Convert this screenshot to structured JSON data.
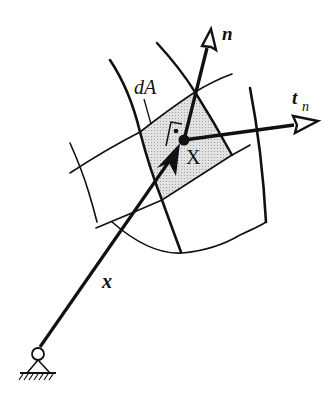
{
  "diagram": {
    "type": "continuum-mechanics-traction-vector",
    "labels": {
      "normal": "n",
      "traction": "t",
      "traction_sub": "n",
      "area_element": "dA",
      "point": "X",
      "position": "x"
    },
    "colors": {
      "ink": "#111111",
      "patch_fill": "#d9d9d9",
      "background": "#ffffff"
    },
    "elements": [
      "fixed pin support (origin)",
      "position vector x from origin to point X",
      "curvilinear grid on deformed body surface",
      "shaded area element dA containing X",
      "right-angle marker between n and surface",
      "unit normal vector n",
      "traction vector t_n"
    ]
  }
}
